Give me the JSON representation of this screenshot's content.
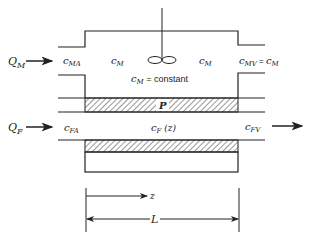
{
  "diagram": {
    "top_channel": {
      "inlet_flow": {
        "symbol": "Q",
        "sub": "M"
      },
      "inlet_conc": {
        "symbol": "c",
        "sub": "MA"
      },
      "bulk_conc_left": {
        "symbol": "c",
        "sub": "M"
      },
      "bulk_conc_right": {
        "symbol": "c",
        "sub": "M"
      },
      "outlet_conc": {
        "symbol": "c",
        "sub": "MV",
        "eq": " = ",
        "symbol2": "c",
        "sub2": "M"
      },
      "note": {
        "symbol": "c",
        "sub": "M",
        "text": " = constant"
      },
      "agitator": "stirrer-propeller"
    },
    "membrane": {
      "label": "P"
    },
    "bottom_channel": {
      "inlet_flow": {
        "symbol": "Q",
        "sub": "F"
      },
      "inlet_conc": {
        "symbol": "c",
        "sub": "FA"
      },
      "profile_conc": {
        "symbol": "c",
        "sub": "F",
        "arg": " (z)"
      },
      "outlet_conc": {
        "symbol": "c",
        "sub": "FV"
      }
    },
    "dimensions": {
      "position_label": "z",
      "length_label": "L"
    },
    "colors": {
      "line": "#222222",
      "background": "#ffffff"
    }
  }
}
